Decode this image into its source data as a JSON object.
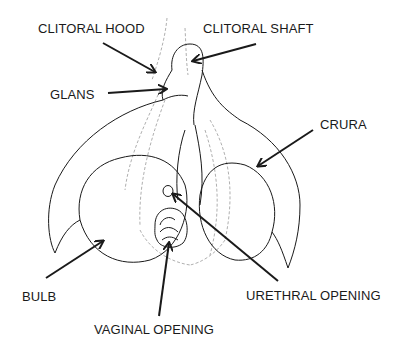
{
  "diagram": {
    "labels": {
      "clitoral_hood": "CLITORAL HOOD",
      "clitoral_shaft": "CLITORAL SHAFT",
      "glans": "GLANS",
      "crura": "CRURA",
      "bulb": "BULB",
      "urethral_opening": "URETHRAL OPENING",
      "vaginal_opening": "VAGINAL OPENING"
    },
    "colors": {
      "line": "#1a1a1a",
      "sketch": "#8a8a8a",
      "background": "#ffffff"
    }
  }
}
